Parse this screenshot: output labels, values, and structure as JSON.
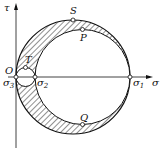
{
  "diagram": {
    "type": "mohr-circle",
    "axes": {
      "x_label": "σ",
      "y_label": "τ",
      "origin_label": "O"
    },
    "points": [
      {
        "id": "S",
        "label": "S"
      },
      {
        "id": "P",
        "label": "P"
      },
      {
        "id": "Q",
        "label": "Q"
      },
      {
        "id": "T",
        "label": "T"
      },
      {
        "id": "sigma1",
        "label": "σ",
        "sub": "1"
      },
      {
        "id": "sigma2",
        "label": "σ",
        "sub": "2"
      },
      {
        "id": "sigma3",
        "label": "σ",
        "sub": "3"
      }
    ],
    "shaded_region": "between large circle (σ3–σ1) and circles (σ3–σ2), (σ2–σ1)"
  }
}
